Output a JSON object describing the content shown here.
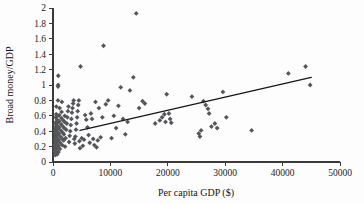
{
  "chart_data": {
    "type": "scatter",
    "title": "",
    "xlabel": "Per capita GDP ($)",
    "ylabel": "Broad money/GDP",
    "xlim": [
      0,
      50000
    ],
    "ylim": [
      0,
      2
    ],
    "grid": false,
    "legend": null,
    "xticks": [
      0,
      10000,
      20000,
      30000,
      40000,
      50000
    ],
    "xtick_labels": [
      "0",
      "10000",
      "20000",
      "30000",
      "40000",
      "50000"
    ],
    "yticks": [
      0,
      0.2,
      0.4,
      0.6,
      0.8,
      1,
      1.2,
      1.4,
      1.6,
      1.8,
      2
    ],
    "ytick_labels": [
      "0",
      "0.2",
      "0.4",
      "0.6",
      "0.8",
      "1",
      "1.2",
      "1.4",
      "1.6",
      "1.8",
      "2"
    ],
    "marker": "diamond",
    "marker_color": "#55565a",
    "trendline": {
      "color": "#17171a",
      "x": [
        4700,
        45000
      ],
      "y": [
        0.41,
        1.1
      ]
    },
    "points": [
      [
        300,
        0.14
      ],
      [
        320,
        0.22
      ],
      [
        340,
        0.3
      ],
      [
        350,
        0.38
      ],
      [
        360,
        0.45
      ],
      [
        380,
        0.09
      ],
      [
        400,
        0.18
      ],
      [
        410,
        0.26
      ],
      [
        420,
        0.34
      ],
      [
        430,
        0.41
      ],
      [
        450,
        0.5
      ],
      [
        460,
        0.58
      ],
      [
        470,
        0.12
      ],
      [
        480,
        0.2
      ],
      [
        500,
        0.28
      ],
      [
        510,
        0.36
      ],
      [
        520,
        0.44
      ],
      [
        540,
        0.52
      ],
      [
        560,
        0.62
      ],
      [
        580,
        0.72
      ],
      [
        600,
        0.16
      ],
      [
        620,
        0.24
      ],
      [
        640,
        0.32
      ],
      [
        660,
        0.4
      ],
      [
        680,
        0.47
      ],
      [
        700,
        0.55
      ],
      [
        720,
        0.1
      ],
      [
        740,
        0.19
      ],
      [
        760,
        0.27
      ],
      [
        780,
        0.35
      ],
      [
        800,
        0.43
      ],
      [
        820,
        0.51
      ],
      [
        840,
        0.6
      ],
      [
        860,
        0.8
      ],
      [
        880,
        0.98
      ],
      [
        900,
        1.0
      ],
      [
        920,
        1.12
      ],
      [
        950,
        0.13
      ],
      [
        980,
        0.21
      ],
      [
        1000,
        0.29
      ],
      [
        1020,
        0.37
      ],
      [
        1050,
        0.45
      ],
      [
        1080,
        0.53
      ],
      [
        1100,
        0.61
      ],
      [
        1150,
        0.7
      ],
      [
        1200,
        0.17
      ],
      [
        1250,
        0.25
      ],
      [
        1300,
        0.33
      ],
      [
        1350,
        0.41
      ],
      [
        1400,
        0.49
      ],
      [
        1450,
        0.57
      ],
      [
        1500,
        0.65
      ],
      [
        1550,
        0.78
      ],
      [
        1600,
        0.22
      ],
      [
        1650,
        0.3
      ],
      [
        1700,
        0.38
      ],
      [
        1750,
        0.46
      ],
      [
        1800,
        0.54
      ],
      [
        1850,
        0.28
      ],
      [
        1900,
        0.36
      ],
      [
        1950,
        0.44
      ],
      [
        2000,
        0.52
      ],
      [
        2050,
        0.6
      ],
      [
        2100,
        0.2
      ],
      [
        2200,
        0.31
      ],
      [
        2300,
        0.42
      ],
      [
        2400,
        0.5
      ],
      [
        2500,
        0.58
      ],
      [
        2600,
        0.66
      ],
      [
        2700,
        0.72
      ],
      [
        2800,
        0.26
      ],
      [
        2900,
        0.34
      ],
      [
        3000,
        0.4
      ],
      [
        3100,
        0.48
      ],
      [
        3200,
        0.56
      ],
      [
        3300,
        0.64
      ],
      [
        3400,
        0.7
      ],
      [
        3500,
        0.76
      ],
      [
        3600,
        0.8
      ],
      [
        3700,
        0.3
      ],
      [
        3800,
        0.24
      ],
      [
        3900,
        0.33
      ],
      [
        4000,
        0.42
      ],
      [
        4100,
        0.5
      ],
      [
        4200,
        0.58
      ],
      [
        4300,
        0.66
      ],
      [
        4400,
        0.74
      ],
      [
        4500,
        0.8
      ],
      [
        4600,
        0.27
      ],
      [
        4700,
        0.18
      ],
      [
        4800,
        1.24
      ],
      [
        5000,
        0.31
      ],
      [
        5200,
        0.21
      ],
      [
        5400,
        0.29
      ],
      [
        5600,
        0.61
      ],
      [
        5800,
        0.55
      ],
      [
        6000,
        0.45
      ],
      [
        6200,
        0.35
      ],
      [
        6400,
        0.25
      ],
      [
        6600,
        0.63
      ],
      [
        6800,
        0.56
      ],
      [
        7000,
        0.3
      ],
      [
        7200,
        0.22
      ],
      [
        7400,
        0.78
      ],
      [
        7600,
        0.19
      ],
      [
        7800,
        0.28
      ],
      [
        8000,
        0.7
      ],
      [
        8300,
        0.32
      ],
      [
        8600,
        0.58
      ],
      [
        8800,
        1.51
      ],
      [
        9200,
        0.75
      ],
      [
        9600,
        0.8
      ],
      [
        10200,
        0.31
      ],
      [
        10600,
        0.6
      ],
      [
        11000,
        0.44
      ],
      [
        11400,
        0.73
      ],
      [
        11800,
        0.97
      ],
      [
        12200,
        0.56
      ],
      [
        12600,
        0.36
      ],
      [
        13000,
        0.52
      ],
      [
        13400,
        0.93
      ],
      [
        14000,
        1.1
      ],
      [
        14500,
        1.93
      ],
      [
        15000,
        0.7
      ],
      [
        15600,
        0.79
      ],
      [
        16000,
        0.76
      ],
      [
        17800,
        0.5
      ],
      [
        18600,
        0.54
      ],
      [
        19000,
        0.58
      ],
      [
        19400,
        0.62
      ],
      [
        19600,
        0.52
      ],
      [
        19800,
        0.88
      ],
      [
        20200,
        0.63
      ],
      [
        20400,
        0.56
      ],
      [
        20600,
        0.51
      ],
      [
        24200,
        0.85
      ],
      [
        25400,
        0.37
      ],
      [
        25600,
        0.33
      ],
      [
        25800,
        0.41
      ],
      [
        26200,
        0.79
      ],
      [
        26600,
        0.74
      ],
      [
        27000,
        0.69
      ],
      [
        27200,
        0.63
      ],
      [
        27600,
        0.46
      ],
      [
        28200,
        0.5
      ],
      [
        28600,
        0.44
      ],
      [
        29600,
        0.91
      ],
      [
        30200,
        0.58
      ],
      [
        34600,
        0.41
      ],
      [
        41000,
        1.15
      ],
      [
        44000,
        1.24
      ],
      [
        44800,
        1.0
      ]
    ]
  }
}
